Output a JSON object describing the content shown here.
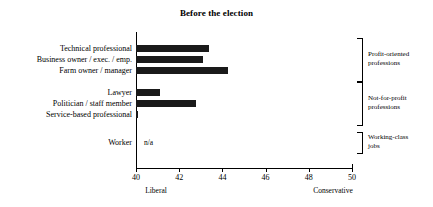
{
  "chart_data": {
    "type": "bar",
    "orientation": "horizontal",
    "title": "Before the election",
    "xlabel": "",
    "ylabel": "",
    "xlim": [
      40,
      50
    ],
    "xticks": [
      40,
      42,
      44,
      46,
      48,
      50
    ],
    "xtick_labels": [
      "40",
      "42",
      "44",
      "46",
      "48",
      "50"
    ],
    "grid": false,
    "legend": false,
    "axis_end_labels": {
      "left": "Liberal",
      "right": "Conservative"
    },
    "categories": [
      "Technical professional",
      "Business owner / exec. / emp.",
      "Farm owner / manager",
      "Lawyer",
      "Politician / staff member",
      "Service-based professional",
      "Worker"
    ],
    "values": [
      43.4,
      43.1,
      44.25,
      41.1,
      42.8,
      40.07,
      null
    ],
    "value_annotations": [
      "",
      "",
      "",
      "",
      "",
      "",
      "n/a"
    ],
    "groups": [
      {
        "label": "Profit-oriented professions",
        "categories": [
          "Technical professional",
          "Business owner / exec. / emp.",
          "Farm owner / manager"
        ]
      },
      {
        "label": "Not-for-profit professions",
        "categories": [
          "Lawyer",
          "Politician / staff member",
          "Service-based professional"
        ]
      },
      {
        "label": "Working-class jobs",
        "categories": [
          "Worker"
        ]
      }
    ],
    "bar_color": "#1a1a1a"
  },
  "axis": {
    "ticks": [
      {
        "value": "40"
      },
      {
        "value": "42"
      },
      {
        "value": "44"
      },
      {
        "value": "46"
      },
      {
        "value": "48"
      },
      {
        "value": "50"
      }
    ],
    "left_label": "Liberal",
    "right_label": "Conservative"
  },
  "brackets": [
    {
      "line1": "Profit-oriented",
      "line2": "professions"
    },
    {
      "line1": "Not-for-profit",
      "line2": "professions"
    },
    {
      "line1": "Working-class",
      "line2": "jobs"
    }
  ],
  "rows": [
    {
      "label": "Technical professional",
      "annotation": ""
    },
    {
      "label": "Business owner / exec. / emp.",
      "annotation": ""
    },
    {
      "label": "Farm owner / manager",
      "annotation": ""
    },
    {
      "label": "Lawyer",
      "annotation": ""
    },
    {
      "label": "Politician / staff member",
      "annotation": ""
    },
    {
      "label": "Service-based professional",
      "annotation": ""
    },
    {
      "label": "Worker",
      "annotation": "n/a"
    }
  ],
  "title": "Before the election"
}
